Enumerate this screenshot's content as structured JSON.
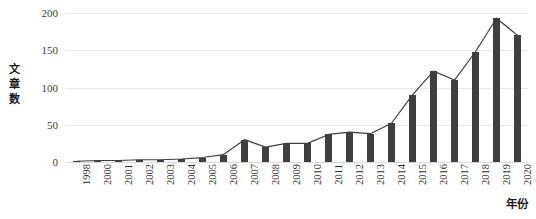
{
  "chart_data": {
    "type": "bar",
    "title": "",
    "subtitle": "",
    "xlabel": "年份",
    "ylabel": "文章数",
    "ylabel_chars": [
      "文",
      "章",
      "数"
    ],
    "categories": [
      "1998",
      "2000",
      "2001",
      "2002",
      "2003",
      "2004",
      "2005",
      "2006",
      "2007",
      "2008",
      "2009",
      "2010",
      "2011",
      "2012",
      "2013",
      "2014",
      "2015",
      "2016",
      "2017",
      "2018",
      "2019",
      "2020"
    ],
    "values": [
      1,
      2,
      2,
      3,
      3,
      4,
      6,
      10,
      30,
      20,
      25,
      25,
      37,
      40,
      38,
      52,
      90,
      122,
      110,
      148,
      193,
      170
    ],
    "series": [
      {
        "name": "文章数",
        "type": "bar",
        "values": [
          1,
          2,
          2,
          3,
          3,
          4,
          6,
          10,
          30,
          20,
          25,
          25,
          37,
          40,
          38,
          52,
          90,
          122,
          110,
          148,
          193,
          170
        ]
      },
      {
        "name": "文章数趋势线",
        "type": "line",
        "values": [
          1,
          2,
          2,
          3,
          3,
          4,
          6,
          10,
          30,
          20,
          25,
          25,
          37,
          40,
          38,
          52,
          90,
          122,
          110,
          148,
          193,
          170
        ]
      }
    ],
    "ylim": [
      0,
      200
    ],
    "yticks": [
      0,
      50,
      100,
      150,
      200
    ],
    "ytick_labels": [
      "0",
      "50",
      "100",
      "150",
      "200"
    ],
    "grid": true,
    "grid_axis": "y",
    "legend": false,
    "legend_position": "none",
    "colors": {
      "bar": "#3f3f3f",
      "line": "#3f3f3f",
      "grid": "#e9e9e9",
      "axis_text": "#303030",
      "background": "#ffffff"
    }
  }
}
